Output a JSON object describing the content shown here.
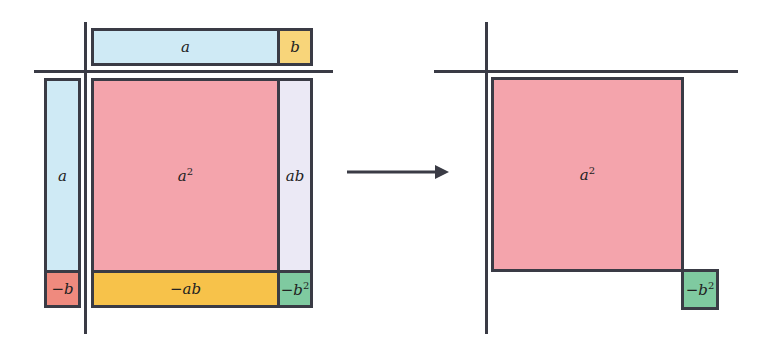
{
  "colors": {
    "line": "#3a3b45",
    "blue": "#cfeaf5",
    "yellow_light": "#f8d57a",
    "pink": "#f4a4ac",
    "lavender": "#ebe9f5",
    "orange": "#f7c24a",
    "red": "#ef8a7e",
    "green": "#7fcaa0"
  },
  "left_diagram": {
    "top_bar": {
      "a_label": "a",
      "b_label": "b"
    },
    "left_bar": {
      "a_label": "a",
      "neg_b_label": "−b"
    },
    "grid": {
      "a_squared_label": "a",
      "a_squared_exp": "2",
      "ab_label": "ab",
      "neg_ab_label": "−ab",
      "neg_b_squared_label": "−b",
      "neg_b_squared_exp": "2"
    }
  },
  "arrow": {
    "icon": "right-arrow-icon"
  },
  "right_diagram": {
    "a_squared_label": "a",
    "a_squared_exp": "2",
    "neg_b_squared_label": "−b",
    "neg_b_squared_exp": "2"
  }
}
